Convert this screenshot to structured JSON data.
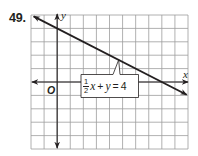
{
  "problem": {
    "number": "49."
  },
  "chart_data": {
    "type": "line",
    "title": "",
    "xlabel": "x",
    "ylabel": "y",
    "origin_label": "O",
    "grid": true,
    "xlim": [
      -2,
      10
    ],
    "ylim": [
      -5,
      5
    ],
    "grid_step": 1,
    "series": [
      {
        "name": "1/2x + y = 4",
        "equation": "(1/2)x + y = 4",
        "slope": -0.5,
        "y_intercept": 4,
        "x_intercept": 8,
        "x": [
          -1.8,
          0,
          8,
          9.9
        ],
        "y": [
          4.9,
          4,
          0,
          -0.95
        ],
        "arrows": "both"
      }
    ],
    "annotation": {
      "text_fraction_num": "1",
      "text_fraction_den": "2",
      "text_var1": "x",
      "text_plus": "+",
      "text_var2": "y",
      "text_eq": "=",
      "text_rhs": "4",
      "points_to": [
        4.7,
        1.65
      ]
    },
    "colors": {
      "line": "#231f20",
      "grid": "#9d9d9d",
      "box_border": "#231f20"
    }
  }
}
